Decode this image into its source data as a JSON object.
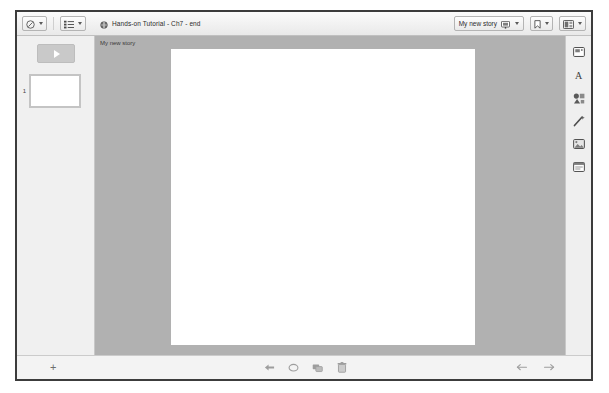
{
  "window": {
    "title": "Hands-on Tutorial - Ch7 - end"
  },
  "toolbar": {
    "theme_button": {
      "icon": "palette-icon",
      "caret": "chevron-down-icon"
    },
    "layout_button": {
      "icon": "layout-list-icon",
      "caret": "chevron-down-icon"
    },
    "document_icon": "document-globe-icon",
    "document_title": "Hands-on Tutorial - Ch7 - end",
    "story_button": {
      "label": "My new story",
      "icon": "presentation-screen-icon",
      "caret": "chevron-down-icon"
    },
    "bookmark_button": {
      "icon": "bookmark-icon",
      "caret": "chevron-down-icon"
    },
    "share_button": {
      "icon": "share-window-icon",
      "caret": "chevron-down-icon"
    }
  },
  "slide_panel": {
    "play_button_label": "play-icon",
    "slides": [
      {
        "index": "1",
        "name": "slide-thumbnail-1"
      }
    ]
  },
  "canvas": {
    "story_label": "My new story",
    "slide_name": "slide-canvas"
  },
  "tool_rail": {
    "items": [
      {
        "name": "slide-frame-icon",
        "glyph": "frame"
      },
      {
        "name": "text-tool-icon",
        "glyph": "A"
      },
      {
        "name": "shapes-tool-icon",
        "glyph": "shapes"
      },
      {
        "name": "magic-wand-icon",
        "glyph": "wand"
      },
      {
        "name": "image-tool-icon",
        "glyph": "image"
      },
      {
        "name": "media-tool-icon",
        "glyph": "media"
      }
    ]
  },
  "bottom_bar": {
    "add_slide_label": "+",
    "center_tools": [
      {
        "name": "pointer-tool-icon"
      },
      {
        "name": "shape-tool-icon"
      },
      {
        "name": "duplicate-tool-icon"
      },
      {
        "name": "delete-tool-icon"
      }
    ],
    "undo": {
      "name": "undo-icon"
    },
    "redo": {
      "name": "redo-icon"
    }
  },
  "colors": {
    "window_border": "#3c3c3c",
    "canvas_background": "#b1b1b1",
    "slide_white": "#ffffff",
    "panel_background": "#f0f0f0",
    "toolbar_background": "#f3f3f3"
  }
}
